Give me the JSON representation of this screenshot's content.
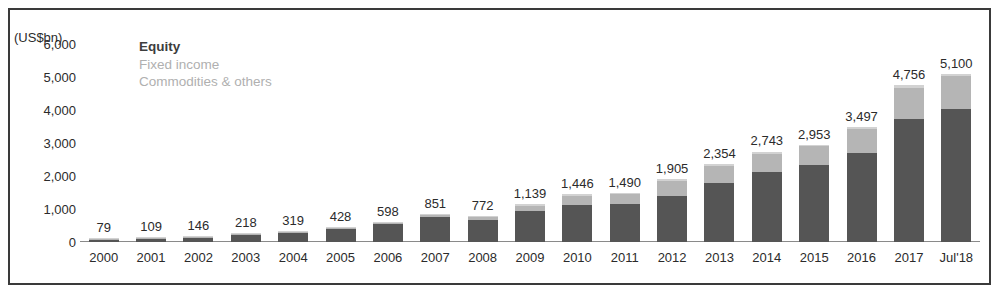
{
  "chart_data": {
    "type": "bar",
    "title": "",
    "subtitle": "",
    "unit_label": "(US$bn)",
    "xlabel": "",
    "ylabel": "",
    "ylim": [
      0,
      6000
    ],
    "yticks": [
      "0",
      "1,000",
      "2,000",
      "3,000",
      "4,000",
      "5,000",
      "6,000"
    ],
    "ytick_values": [
      0,
      1000,
      2000,
      3000,
      4000,
      5000,
      6000
    ],
    "grid": false,
    "stacked": true,
    "legend_position": "top-left",
    "legend": [
      {
        "label": "Equity",
        "color": "#555555",
        "emphasis": "bold"
      },
      {
        "label": "Fixed income",
        "color": "#b5b5b5",
        "emphasis": "normal"
      },
      {
        "label": "Commodities & others",
        "color": "#d2d2d2",
        "emphasis": "normal"
      }
    ],
    "categories": [
      "2000",
      "2001",
      "2002",
      "2003",
      "2004",
      "2005",
      "2006",
      "2007",
      "2008",
      "2009",
      "2010",
      "2011",
      "2012",
      "2013",
      "2014",
      "2015",
      "2016",
      "2017",
      "Jul'18"
    ],
    "totals": [
      79,
      109,
      146,
      218,
      319,
      428,
      598,
      851,
      772,
      1139,
      1446,
      1490,
      1905,
      2354,
      2743,
      2953,
      3497,
      4756,
      5100
    ],
    "total_labels": [
      "79",
      "109",
      "146",
      "218",
      "319",
      "428",
      "598",
      "851",
      "772",
      "1,139",
      "1,446",
      "1,490",
      "1,905",
      "2,354",
      "2,743",
      "2,953",
      "3,497",
      "4,756",
      "5,100"
    ],
    "series": [
      {
        "name": "Equity",
        "color": "#555555",
        "values": [
          72,
          99,
          133,
          198,
          288,
          386,
          533,
          744,
          668,
          950,
          1120,
          1150,
          1380,
          1790,
          2120,
          2330,
          2700,
          3740,
          4030
        ]
      },
      {
        "name": "Fixed income",
        "color": "#b5b5b5",
        "values": [
          5,
          7,
          9,
          14,
          22,
          31,
          48,
          84,
          81,
          150,
          280,
          300,
          470,
          510,
          560,
          570,
          720,
          930,
          1010
        ]
      },
      {
        "name": "Commodities & others",
        "color": "#d2d2d2",
        "values": [
          2,
          3,
          4,
          6,
          9,
          11,
          17,
          23,
          23,
          39,
          46,
          40,
          55,
          54,
          63,
          53,
          77,
          86,
          60
        ]
      }
    ]
  }
}
